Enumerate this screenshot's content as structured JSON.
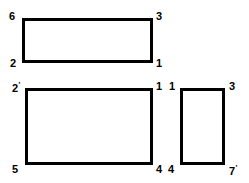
{
  "diagram": {
    "type": "line-art-rectangles",
    "background_color": "#ffffff",
    "stroke_color": "#000000",
    "label_color": "#000000",
    "shapes": [
      {
        "name": "rectangle-top",
        "x": 22,
        "y": 18,
        "width": 131,
        "height": 45,
        "stroke_width": 3,
        "vertices": [
          {
            "label": "6",
            "prime": "",
            "corner": "top-left"
          },
          {
            "label": "3",
            "prime": "",
            "corner": "top-right"
          },
          {
            "label": "1",
            "prime": "",
            "corner": "bottom-right"
          },
          {
            "label": "2",
            "prime": "",
            "corner": "bottom-left"
          }
        ]
      },
      {
        "name": "rectangle-bottom-left",
        "x": 25,
        "y": 88,
        "width": 128,
        "height": 77,
        "stroke_width": 3,
        "vertices": [
          {
            "label": "2",
            "prime": "'",
            "corner": "top-left"
          },
          {
            "label": "1",
            "prime": "",
            "corner": "top-right"
          },
          {
            "label": "4",
            "prime": "",
            "corner": "bottom-right"
          },
          {
            "label": "5",
            "prime": "",
            "corner": "bottom-left"
          }
        ]
      },
      {
        "name": "rectangle-bottom-right",
        "x": 180,
        "y": 88,
        "width": 45,
        "height": 77,
        "stroke_width": 3,
        "vertices": [
          {
            "label": "1",
            "prime": "",
            "corner": "top-left"
          },
          {
            "label": "3",
            "prime": "",
            "corner": "top-right"
          },
          {
            "label": "7",
            "prime": "'",
            "corner": "bottom-right"
          },
          {
            "label": "4",
            "prime": "",
            "corner": "bottom-left"
          }
        ]
      }
    ],
    "labels": [
      {
        "name": "label-6",
        "text": "6",
        "prime": "",
        "x": 9,
        "y": 11,
        "size": 11
      },
      {
        "name": "label-3-top-right",
        "text": "3",
        "prime": "",
        "x": 156,
        "y": 11,
        "size": 11
      },
      {
        "name": "label-2-bottom-left-top",
        "text": "2",
        "prime": "",
        "x": 10,
        "y": 58,
        "size": 11
      },
      {
        "name": "label-1-bottom-right-top",
        "text": "1",
        "prime": "",
        "x": 156,
        "y": 58,
        "size": 11
      },
      {
        "name": "label-2-prime",
        "text": "2",
        "prime": "'",
        "x": 12,
        "y": 81,
        "size": 11
      },
      {
        "name": "label-1-mid-top-right",
        "text": "1",
        "prime": "",
        "x": 156,
        "y": 81,
        "size": 11
      },
      {
        "name": "label-1-right-top-left",
        "text": "1",
        "prime": "",
        "x": 169,
        "y": 81,
        "size": 11
      },
      {
        "name": "label-3-right-top-right",
        "text": "3",
        "prime": "",
        "x": 229,
        "y": 81,
        "size": 11
      },
      {
        "name": "label-5",
        "text": "5",
        "prime": "",
        "x": 12,
        "y": 164,
        "size": 11
      },
      {
        "name": "label-4-mid-bottom-right",
        "text": "4",
        "prime": "",
        "x": 156,
        "y": 164,
        "size": 11
      },
      {
        "name": "label-4-right-bottom-left",
        "text": "4",
        "prime": "",
        "x": 168,
        "y": 164,
        "size": 11
      },
      {
        "name": "label-7-prime",
        "text": "7",
        "prime": "'",
        "x": 229,
        "y": 164,
        "size": 11
      }
    ]
  }
}
